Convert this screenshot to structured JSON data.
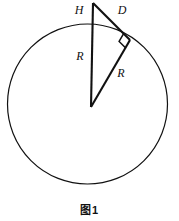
{
  "figure": {
    "caption": "图1",
    "background_color": "#ffffff",
    "stroke_color": "#111111",
    "labels": {
      "height_segment": "H",
      "tangent_segment": "D",
      "radius_vertical": "R",
      "radius_tangent": "R"
    },
    "geometry": {
      "circle": {
        "cx": 87.5,
        "cy": 104,
        "r": 80,
        "stroke_width": 1.2
      },
      "apex_point": {
        "x": 93,
        "y": 3
      },
      "center_point": {
        "x": 91,
        "y": 107
      },
      "tangent_point": {
        "x": 130,
        "y": 40
      },
      "top_of_circle": {
        "x": 91,
        "y": 24
      },
      "right_angle_marker_size": 9,
      "thick_stroke_width": 2.1
    },
    "label_positions": {
      "height_segment": {
        "x": 79,
        "y": 11
      },
      "tangent_segment": {
        "x": 122,
        "y": 11
      },
      "radius_vertical": {
        "x": 80,
        "y": 57
      },
      "radius_tangent": {
        "x": 121,
        "y": 74
      }
    }
  }
}
